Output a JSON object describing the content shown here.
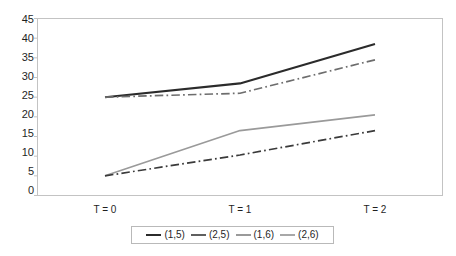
{
  "chart_data": {
    "type": "line",
    "title": "",
    "xlabel": "",
    "ylabel": "",
    "categories": [
      "T = 0",
      "T = 1",
      "T = 2"
    ],
    "ylim": [
      0,
      45
    ],
    "yticks": [
      0,
      5,
      10,
      15,
      20,
      25,
      30,
      35,
      40,
      45
    ],
    "ytick_labels": [
      "0",
      "5",
      "10",
      "15",
      "20",
      "25",
      "30",
      "35",
      "40",
      "45"
    ],
    "grid": false,
    "legend_position": "bottom",
    "series": [
      {
        "name": "(1,5)",
        "values": [
          25,
          28.5,
          38.5
        ],
        "color": "#2b2b2b",
        "style": "solid",
        "width": 2.1
      },
      {
        "name": "(2,5)",
        "values": [
          25,
          26,
          34.5
        ],
        "color": "#6d6d6d",
        "style": "dashdot",
        "width": 1.7
      },
      {
        "name": "(1,6)",
        "values": [
          5,
          16.5,
          20.5
        ],
        "color": "#9a9a9a",
        "style": "solid",
        "width": 1.6
      },
      {
        "name": "(2,6)",
        "values": [
          5,
          10.3,
          16.5
        ],
        "color": "#3a3a3a",
        "style": "dashdot",
        "width": 1.7
      }
    ],
    "legend": [
      {
        "label": "(1,5)",
        "color": "#2b2b2b",
        "style": "solid"
      },
      {
        "label": "(2,5)",
        "color": "#5f5f5f",
        "style": "solid"
      },
      {
        "label": "(1,6)",
        "color": "#9a9a9a",
        "style": "solid"
      },
      {
        "label": "(2,6)",
        "color": "#a8a8a8",
        "style": "solid"
      }
    ],
    "axis": {
      "frame_color": "#bdbdbd",
      "plot_background": "#ffffff"
    }
  }
}
